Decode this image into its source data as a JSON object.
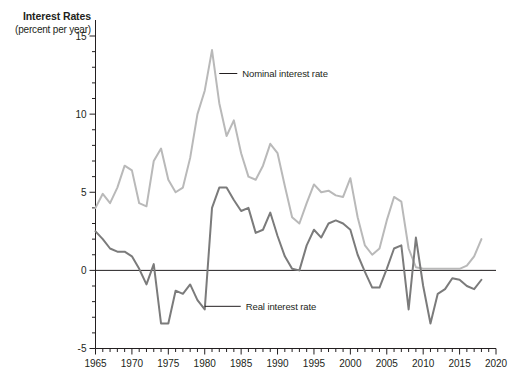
{
  "chart_data": {
    "type": "line",
    "title": "Interest Rates",
    "subtitle": "(percent per year)",
    "ylabel": "Interest Rates (percent per year)",
    "xlabel": "",
    "xlim": [
      1965,
      2020
    ],
    "ylim": [
      -5,
      15
    ],
    "y_ticks": [
      -5,
      0,
      5,
      10,
      15
    ],
    "y_minor_step": 1,
    "x_ticks": [
      1965,
      1970,
      1975,
      1980,
      1985,
      1990,
      1995,
      2000,
      2005,
      2010,
      2015,
      2020
    ],
    "x_minor_step": 1,
    "grid": false,
    "legend_position": "inline-annotation",
    "annotations": [
      {
        "text": "Nominal interest rate",
        "x": 1982,
        "y": 12.6
      },
      {
        "text": "Real interest rate",
        "x": 1980,
        "y": -2.3
      }
    ],
    "colors": {
      "nominal": "#b9b9b9",
      "real": "#7b7b7b",
      "axis": "#231f20"
    },
    "x": [
      1965,
      1966,
      1967,
      1968,
      1969,
      1970,
      1971,
      1972,
      1973,
      1974,
      1975,
      1976,
      1977,
      1978,
      1979,
      1980,
      1981,
      1982,
      1983,
      1984,
      1985,
      1986,
      1987,
      1988,
      1989,
      1990,
      1991,
      1992,
      1993,
      1994,
      1995,
      1996,
      1997,
      1998,
      1999,
      2000,
      2001,
      2002,
      2003,
      2004,
      2005,
      2006,
      2007,
      2008,
      2009,
      2010,
      2011,
      2012,
      2013,
      2014,
      2015,
      2016,
      2017,
      2018
    ],
    "series": [
      {
        "name": "Nominal interest rate",
        "color": "#b9b9b9",
        "values": [
          4.0,
          4.9,
          4.3,
          5.3,
          6.7,
          6.4,
          4.3,
          4.1,
          7.0,
          7.8,
          5.8,
          5.0,
          5.3,
          7.2,
          10.0,
          11.5,
          14.1,
          10.7,
          8.6,
          9.6,
          7.5,
          6.0,
          5.8,
          6.7,
          8.1,
          7.5,
          5.4,
          3.4,
          3.0,
          4.3,
          5.5,
          5.0,
          5.1,
          4.8,
          4.7,
          5.9,
          3.4,
          1.6,
          1.0,
          1.4,
          3.2,
          4.7,
          4.4,
          1.4,
          0.2,
          0.1,
          0.1,
          0.1,
          0.1,
          0.1,
          0.1,
          0.3,
          0.9,
          2.0
        ]
      },
      {
        "name": "Real interest rate",
        "color": "#7b7b7b",
        "values": [
          2.5,
          2.0,
          1.4,
          1.2,
          1.2,
          0.9,
          0.1,
          -0.9,
          0.4,
          -3.4,
          -3.4,
          -1.3,
          -1.5,
          -0.9,
          -1.9,
          -2.5,
          4.0,
          5.3,
          5.3,
          4.5,
          3.8,
          4.0,
          2.4,
          2.6,
          3.7,
          2.2,
          0.9,
          0.1,
          0.0,
          1.6,
          2.6,
          2.1,
          3.0,
          3.2,
          3.0,
          2.6,
          1.0,
          -0.1,
          -1.1,
          -1.1,
          0.1,
          1.4,
          1.6,
          -2.5,
          2.1,
          -1.0,
          -3.4,
          -1.5,
          -1.2,
          -0.5,
          -0.6,
          -1.0,
          -1.2,
          -0.6
        ]
      }
    ]
  }
}
